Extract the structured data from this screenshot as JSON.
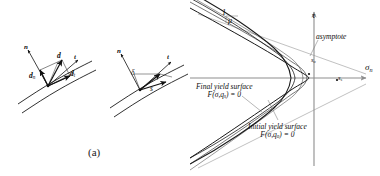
{
  "figure": {
    "caption_a": "(a)",
    "caption_b": "(b)"
  },
  "panel_a": {
    "left_diagram": {
      "normal_vector": "n",
      "tangent_vector": "t",
      "displacement": "d",
      "normal_component": "d",
      "normal_component_sub": "n",
      "tangent_component": "d",
      "tangent_component_sub": "t"
    },
    "right_diagram": {
      "normal_vector": "n",
      "tangent_vector": "t",
      "gap_label": "δ",
      "slip_label": "s"
    }
  },
  "panel_b": {
    "axis_vertical": "τ",
    "axis_horizontal": "σ",
    "axis_horizontal_sub": "n",
    "slope_numerator": "1",
    "slope_denominator": "μ",
    "asymptote": "asymptote",
    "point_initial": "s",
    "point_initial_sub": "o",
    "point_final": "s",
    "point_final_sub": "s",
    "final_surface_line1": "Final yield surface",
    "final_surface_eq_f": "F",
    "final_surface_eq_args": "(σ,q",
    "final_surface_eq_sub": "s",
    "final_surface_eq_tail": ") = 0",
    "initial_surface_line1": "Initial yield surface",
    "initial_surface_eq_f": "F",
    "initial_surface_eq_args": "(σ,q",
    "initial_surface_eq_sub": "o",
    "initial_surface_eq_tail": ") = 0"
  },
  "colors": {
    "ink": "#111111",
    "axis": "#8d8d8d",
    "curve": "#1a1a1a",
    "background": "#ffffff"
  }
}
